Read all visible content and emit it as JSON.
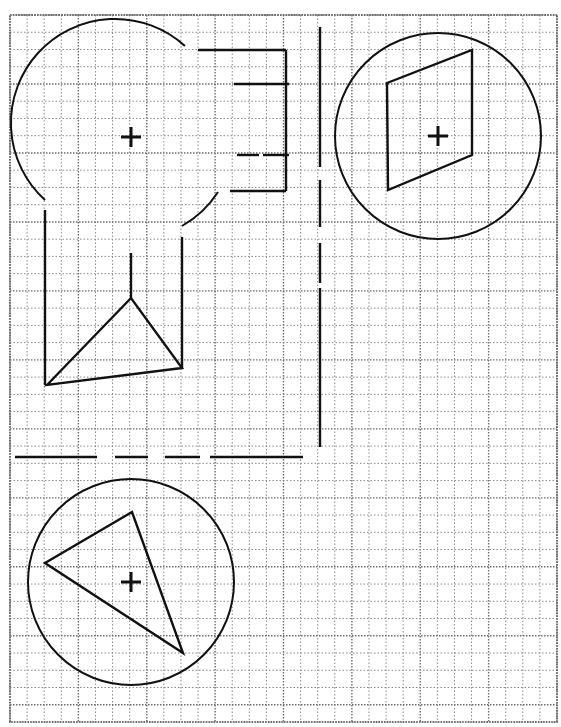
{
  "diagram": {
    "type": "geometric-construction-on-grid",
    "grid": {
      "x0": 10,
      "y0": 15,
      "x1": 557,
      "y1": 722,
      "cell": 17.25,
      "major_every": 4
    },
    "ink_color": "#111111",
    "grid_color": "#8a8a8a",
    "shapes": {
      "circle_top_left_arc": {
        "cx": 131,
        "cy": 137,
        "r": 104,
        "arc_start": [
          185,
          46
        ],
        "arc_end": [
          45,
          200
        ],
        "fragment_start": [
          218,
          192
        ],
        "fragment_end": [
          182,
          226
        ]
      },
      "circle_top_right": {
        "cx": 438,
        "cy": 136,
        "r": 103
      },
      "quadrilateral": [
        [
          387,
          83
        ],
        [
          472,
          50
        ],
        [
          472,
          155
        ],
        [
          388,
          190
        ]
      ],
      "circle_bottom": {
        "cx": 131,
        "cy": 582,
        "r": 103
      },
      "triangle_bottom": [
        [
          45,
          563
        ],
        [
          132,
          512
        ],
        [
          183,
          653
        ]
      ],
      "bracket": {
        "top": [
          [
            198,
            50
          ],
          [
            286,
            50
          ]
        ],
        "right": [
          [
            286,
            50
          ],
          [
            286,
            191
          ]
        ],
        "tick_1": [
          [
            234,
            84
          ],
          [
            289,
            84
          ]
        ],
        "tick_2a": [
          [
            237,
            155
          ],
          [
            259,
            155
          ]
        ],
        "tick_2b": [
          [
            263,
            155
          ],
          [
            289,
            155
          ]
        ],
        "bottom": [
          [
            230,
            191
          ],
          [
            286,
            191
          ]
        ]
      },
      "projection_left": [
        [
          45,
          210
        ],
        [
          45,
          385
        ]
      ],
      "projection_right": [
        [
          182,
          237
        ],
        [
          182,
          368
        ]
      ],
      "apex_stem": [
        [
          131,
          253
        ],
        [
          131,
          298
        ]
      ],
      "side_triangle": [
        [
          47,
          385
        ],
        [
          131,
          298
        ],
        [
          182,
          368
        ]
      ],
      "vertical_axis_segments": [
        [
          27,
          167
        ],
        [
          180,
          227
        ],
        [
          243,
          283
        ],
        [
          288,
          447
        ]
      ],
      "vertical_axis_x": 320,
      "horizontal_axis_segments": [
        [
          15,
          97
        ],
        [
          115,
          148
        ],
        [
          165,
          200
        ],
        [
          210,
          303
        ]
      ],
      "horizontal_axis_y": 457,
      "crosses": [
        [
          131,
          137
        ],
        [
          438,
          136
        ],
        [
          131,
          582
        ]
      ]
    }
  }
}
